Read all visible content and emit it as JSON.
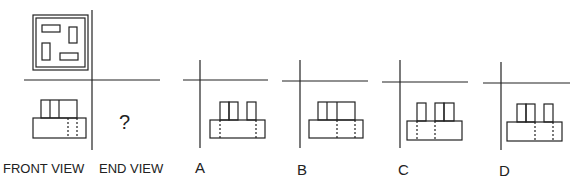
{
  "puzzle": {
    "type": "orthographic-projection",
    "question_mark": "?",
    "labels": {
      "front_view": "FRONT VIEW",
      "end_view": "END VIEW"
    },
    "top_view": {
      "outer_square": "double-bordered square",
      "inner_rectangles": [
        {
          "position": "top-left",
          "orientation": "horizontal"
        },
        {
          "position": "top-right",
          "orientation": "vertical"
        },
        {
          "position": "bottom-left",
          "orientation": "vertical"
        },
        {
          "position": "bottom-right",
          "orientation": "horizontal"
        }
      ]
    },
    "front_view": {
      "base": "wide rectangle",
      "top_blocks": "three adjacent blocks",
      "hidden_lines": 2
    },
    "options": [
      {
        "label": "A",
        "top_blocks": "pair left + single right",
        "hidden_lines": "left and right edges"
      },
      {
        "label": "B",
        "top_blocks": "three adjacent blocks",
        "hidden_lines": "center-right"
      },
      {
        "label": "C",
        "top_blocks": "single left + pair right",
        "hidden_lines": "left side"
      },
      {
        "label": "D",
        "top_blocks": "pair left + single right",
        "hidden_lines": "right side"
      }
    ]
  },
  "colors": {
    "line": "#222222",
    "background": "#ffffff"
  }
}
